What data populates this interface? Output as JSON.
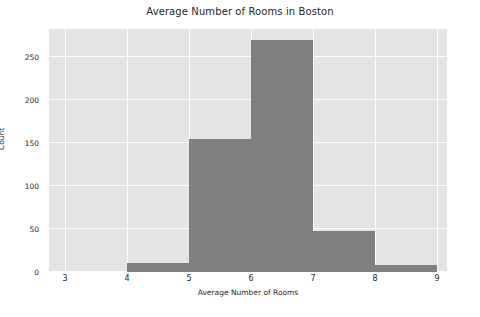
{
  "chart_data": {
    "type": "bar",
    "title": "Average Number of Rooms in Boston",
    "xlabel": "Average Number of Rooms",
    "ylabel": "Count",
    "categories": [
      "3-4",
      "4-5",
      "5-6",
      "6-7",
      "7-8",
      "8-9"
    ],
    "bin_edges": [
      3,
      4,
      5,
      6,
      7,
      8,
      9
    ],
    "values": [
      0,
      10,
      155,
      270,
      48,
      8
    ],
    "xlim": [
      2.74,
      9.16
    ],
    "ylim": [
      0,
      283
    ],
    "xticks": [
      3,
      4,
      5,
      6,
      7,
      8,
      9
    ],
    "xtick_labels": [
      "3",
      "4",
      "5",
      "6",
      "7",
      "8",
      "9"
    ],
    "yticks": [
      0,
      50,
      100,
      150,
      200,
      250
    ],
    "ytick_labels": [
      "0",
      "50",
      "100",
      "150",
      "200",
      "250"
    ],
    "grid": true,
    "grid_color": "#ffffff",
    "legend": null,
    "bar_color": "#808080",
    "plot_background": "#e4e4e4",
    "figure_background": "#ffffff",
    "text_color": "#262626"
  }
}
